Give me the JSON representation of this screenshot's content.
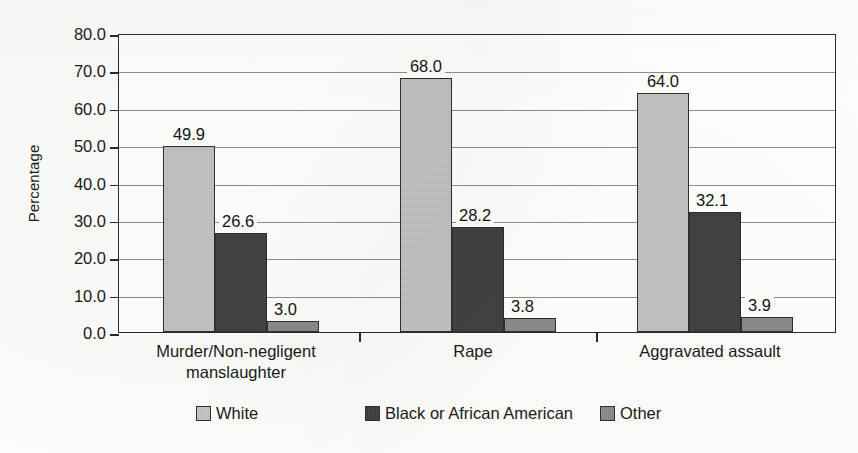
{
  "chart_data": {
    "type": "bar",
    "title": "",
    "xlabel": "",
    "ylabel": "Percentage",
    "ylim": [
      0,
      80
    ],
    "ytick_step": 10,
    "ytick_labels": [
      "80.0",
      "70.0",
      "60.0",
      "50.0",
      "40.0",
      "30.0",
      "20.0",
      "10.0",
      "0.0"
    ],
    "ytick_values": [
      80,
      70,
      60,
      50,
      40,
      30,
      20,
      10,
      0
    ],
    "grid": "horizontal",
    "legend_position": "bottom-center",
    "categories": [
      "Murder/Non-negligent\nmanslaughter",
      "Rape",
      "Aggravated assault"
    ],
    "series": [
      {
        "name": "White",
        "color": "#c5c5c5",
        "values": [
          49.9,
          68.0,
          64.0
        ],
        "labels": [
          "49.9",
          "68.0",
          "64.0"
        ]
      },
      {
        "name": "Black or African American",
        "color": "#3d3d3d",
        "values": [
          26.6,
          28.2,
          32.1
        ],
        "labels": [
          "26.6",
          "28.2",
          "32.1"
        ]
      },
      {
        "name": "Other",
        "color": "#8a8a8a",
        "values": [
          3.0,
          3.8,
          3.9
        ],
        "labels": [
          "3.0",
          "3.8",
          "3.9"
        ]
      }
    ]
  },
  "legend": {
    "items": [
      {
        "label": "White",
        "swatch_name": "legend-swatch-white"
      },
      {
        "label": "Black or African American",
        "swatch_name": "legend-swatch-black-or-african-american"
      },
      {
        "label": "Other",
        "swatch_name": "legend-swatch-other"
      }
    ]
  },
  "axes": {
    "y_title": "Percentage"
  },
  "colors": {
    "axis": "#2b2b2b",
    "gridline": "#8e8e8e",
    "plot_background": "#fffffd",
    "page_background": "#fdfdfb",
    "text": "#1a1a1a"
  }
}
